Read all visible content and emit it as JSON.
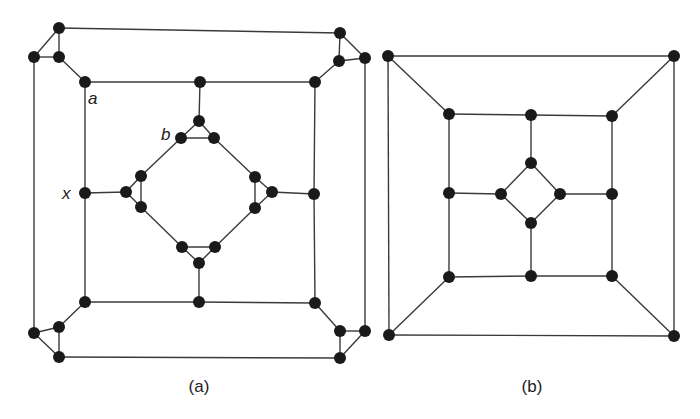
{
  "figure": {
    "panels": [
      {
        "id": "a",
        "caption": "(a)",
        "caption_pos": [
          199,
          392
        ],
        "nodes": {
          "tl1": [
            59,
            28
          ],
          "tl2": [
            34,
            57
          ],
          "tl3": [
            59,
            57
          ],
          "a": [
            85,
            82
          ],
          "tr1": [
            340,
            33
          ],
          "tr2": [
            339,
            61
          ],
          "tr3": [
            365,
            58
          ],
          "tr4": [
            315,
            82
          ],
          "bl1": [
            85,
            302
          ],
          "bl2": [
            59,
            327
          ],
          "bl3": [
            34,
            333
          ],
          "bl4": [
            59,
            357
          ],
          "br1": [
            315,
            303
          ],
          "br2": [
            340,
            331
          ],
          "br3": [
            365,
            331
          ],
          "br4": [
            340,
            358
          ],
          "tm": [
            200,
            82
          ],
          "ct1": [
            199,
            121
          ],
          "b": [
            181,
            138
          ],
          "ct3": [
            214,
            138
          ],
          "x": [
            85,
            193
          ],
          "cl1": [
            126,
            192
          ],
          "cl2": [
            141,
            176
          ],
          "cl3": [
            141,
            207
          ],
          "rm": [
            314,
            194
          ],
          "cr1": [
            272,
            192
          ],
          "cr2": [
            255,
            177
          ],
          "cr3": [
            255,
            208
          ],
          "bm": [
            199,
            302
          ],
          "cb1": [
            199,
            263
          ],
          "cb2": [
            182,
            247
          ],
          "cb3": [
            215,
            247
          ]
        },
        "edges": [
          [
            "tl1",
            "tl2"
          ],
          [
            "tl1",
            "tl3"
          ],
          [
            "tl2",
            "tl3"
          ],
          [
            "tl3",
            "a"
          ],
          [
            "tl1",
            "tr1"
          ],
          [
            "tl2",
            "bl3"
          ],
          [
            "tr1",
            "tr2"
          ],
          [
            "tr1",
            "tr3"
          ],
          [
            "tr2",
            "tr3"
          ],
          [
            "tr2",
            "tr4"
          ],
          [
            "tr3",
            "br3"
          ],
          [
            "bl1",
            "bl2"
          ],
          [
            "bl2",
            "bl3"
          ],
          [
            "bl2",
            "bl4"
          ],
          [
            "bl3",
            "bl4"
          ],
          [
            "bl4",
            "br4"
          ],
          [
            "br1",
            "br2"
          ],
          [
            "br2",
            "br3"
          ],
          [
            "br2",
            "br4"
          ],
          [
            "br3",
            "br4"
          ],
          [
            "a",
            "tm"
          ],
          [
            "tm",
            "tr4"
          ],
          [
            "a",
            "x"
          ],
          [
            "x",
            "bl1"
          ],
          [
            "tr4",
            "rm"
          ],
          [
            "rm",
            "br1"
          ],
          [
            "bl1",
            "bm"
          ],
          [
            "bm",
            "br1"
          ],
          [
            "tm",
            "ct1"
          ],
          [
            "ct1",
            "b"
          ],
          [
            "ct1",
            "ct3"
          ],
          [
            "b",
            "ct3"
          ],
          [
            "x",
            "cl1"
          ],
          [
            "cl1",
            "cl2"
          ],
          [
            "cl1",
            "cl3"
          ],
          [
            "cl2",
            "cl3"
          ],
          [
            "rm",
            "cr1"
          ],
          [
            "cr1",
            "cr2"
          ],
          [
            "cr1",
            "cr3"
          ],
          [
            "cr2",
            "cr3"
          ],
          [
            "bm",
            "cb1"
          ],
          [
            "cb1",
            "cb2"
          ],
          [
            "cb1",
            "cb3"
          ],
          [
            "cb2",
            "cb3"
          ],
          [
            "b",
            "cl2"
          ],
          [
            "ct3",
            "cr2"
          ],
          [
            "cl3",
            "cb2"
          ],
          [
            "cr3",
            "cb3"
          ]
        ],
        "labels": [
          {
            "text": "a",
            "pos": [
              88,
              104
            ]
          },
          {
            "text": "b",
            "pos": [
              161,
              140
            ]
          },
          {
            "text": "x",
            "pos": [
              62,
              199
            ]
          }
        ]
      },
      {
        "id": "b",
        "caption": "(b)",
        "caption_pos": [
          532,
          392
        ],
        "nodes": {
          "o1": [
            388,
            56
          ],
          "o2": [
            674,
            56
          ],
          "o3": [
            389,
            335
          ],
          "o4": [
            674,
            336
          ],
          "m1": [
            449,
            114
          ],
          "m2": [
            531,
            115
          ],
          "m3": [
            612,
            116
          ],
          "m4": [
            449,
            193
          ],
          "m5": [
            612,
            194
          ],
          "m6": [
            449,
            277
          ],
          "m7": [
            531,
            276
          ],
          "m8": [
            612,
            276
          ],
          "i1": [
            531,
            163
          ],
          "i2": [
            501,
            194
          ],
          "i3": [
            560,
            194
          ],
          "i4": [
            531,
            223
          ]
        },
        "edges": [
          [
            "o1",
            "o2"
          ],
          [
            "o2",
            "o4"
          ],
          [
            "o4",
            "o3"
          ],
          [
            "o3",
            "o1"
          ],
          [
            "o1",
            "m1"
          ],
          [
            "o2",
            "m3"
          ],
          [
            "o3",
            "m6"
          ],
          [
            "o4",
            "m8"
          ],
          [
            "m1",
            "m2"
          ],
          [
            "m2",
            "m3"
          ],
          [
            "m3",
            "m5"
          ],
          [
            "m5",
            "m8"
          ],
          [
            "m8",
            "m7"
          ],
          [
            "m7",
            "m6"
          ],
          [
            "m6",
            "m4"
          ],
          [
            "m4",
            "m1"
          ],
          [
            "m2",
            "i1"
          ],
          [
            "m4",
            "i2"
          ],
          [
            "m5",
            "i3"
          ],
          [
            "m7",
            "i4"
          ],
          [
            "i1",
            "i2"
          ],
          [
            "i1",
            "i3"
          ],
          [
            "i2",
            "i4"
          ],
          [
            "i3",
            "i4"
          ]
        ],
        "labels": []
      }
    ],
    "style": {
      "node_radius": 6,
      "edge_color": "#3a3a3a",
      "node_color": "#1a1a1a"
    }
  }
}
